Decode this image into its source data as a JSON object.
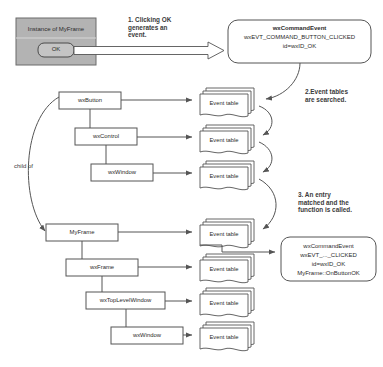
{
  "diagram": {
    "title_hidden": "wxWidgets event handling flow",
    "background": "#ffffff",
    "colors": {
      "stroke": "#555555",
      "frame_fill": "#b3b3b3",
      "button_fill": "#c4c4c4",
      "box_fill": "#ffffff",
      "text": "#2b2b2b"
    }
  },
  "app_window": {
    "title": "Instance of MyFrame",
    "button_label": "OK"
  },
  "notes": [
    {
      "id": "note-1",
      "text": "1. Clicking OK\ngenerates an\nevent."
    },
    {
      "id": "note-2",
      "text": "2.Event tables\nare searched."
    },
    {
      "id": "note-3",
      "text": "3. An entry\nmatched and the\nfunction is called."
    }
  ],
  "event_object": {
    "line1": "wxCommandEvent",
    "line2": "wxEVT_COMMAND_BUTTON_CLICKED",
    "line3": "id=wxID_OK"
  },
  "result_object": {
    "line1": "wxCommandEvent",
    "line2": "wxEVT_..._CLICKED",
    "line3": "id=wxID_OK",
    "line4": "MyFrame::OnButtonOK"
  },
  "relation_label": "child of",
  "class_chain_upper": [
    {
      "label": "wxButton"
    },
    {
      "label": "wxControl"
    },
    {
      "label": "wxWindow"
    }
  ],
  "class_chain_lower": [
    {
      "label": "MyFrame"
    },
    {
      "label": "wxFrame"
    },
    {
      "label": "wxTopLevelWindow"
    },
    {
      "label": "wxWindow"
    }
  ],
  "event_tables": [
    {
      "label": "Event table"
    },
    {
      "label": "Event table"
    },
    {
      "label": "Event table"
    },
    {
      "label": "Event table"
    },
    {
      "label": "Event table"
    },
    {
      "label": "Event table"
    },
    {
      "label": "Event table"
    }
  ]
}
